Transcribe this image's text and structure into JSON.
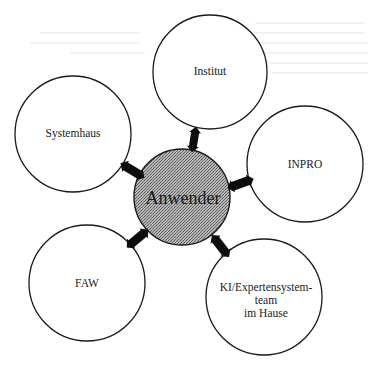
{
  "diagram": {
    "type": "hub-and-spoke",
    "center": {
      "id": "anwender",
      "label": "Anwender",
      "cx": 182,
      "cy": 197,
      "r": 48,
      "fill": "#a9a9a9",
      "stroke": "#1a1a1a"
    },
    "nodes": [
      {
        "id": "institut",
        "lines": [
          "Institut"
        ],
        "cx": 210,
        "cy": 72,
        "r": 57,
        "label_y": 75
      },
      {
        "id": "systemhaus",
        "lines": [
          "Systemhaus"
        ],
        "cx": 73,
        "cy": 134,
        "r": 58,
        "label_y": 137
      },
      {
        "id": "inpro",
        "lines": [
          "INPRO"
        ],
        "cx": 305,
        "cy": 164,
        "r": 58,
        "label_y": 168
      },
      {
        "id": "faw",
        "lines": [
          "FAW"
        ],
        "cx": 87,
        "cy": 283,
        "r": 58,
        "label_y": 287
      },
      {
        "id": "ki-expertensystemteam",
        "lines": [
          "KI/Expertensystem-",
          "team",
          "im Hause"
        ],
        "cx": 264,
        "cy": 297,
        "r": 58,
        "label_y": 291
      }
    ],
    "edges": [
      {
        "from": "anwender",
        "to": "institut",
        "direction": "bidirectional",
        "x1": 192,
        "y1": 152,
        "x2": 196,
        "y2": 127
      },
      {
        "from": "anwender",
        "to": "systemhaus",
        "direction": "bidirectional",
        "x1": 145,
        "y1": 178,
        "x2": 120,
        "y2": 163
      },
      {
        "from": "anwender",
        "to": "inpro",
        "direction": "bidirectional",
        "x1": 228,
        "y1": 188,
        "x2": 253,
        "y2": 179
      },
      {
        "from": "anwender",
        "to": "faw",
        "direction": "bidirectional",
        "x1": 149,
        "y1": 229,
        "x2": 126,
        "y2": 248
      },
      {
        "from": "anwender",
        "to": "ki-expertensystemteam",
        "direction": "bidirectional",
        "x1": 212,
        "y1": 235,
        "x2": 229,
        "y2": 257
      }
    ],
    "colors": {
      "stroke": "#1a1a1a",
      "node_fill": "#ffffff",
      "center_fill": "#a9a9a9",
      "arrow": "#0d0d0d",
      "background": "#ffffff"
    }
  }
}
